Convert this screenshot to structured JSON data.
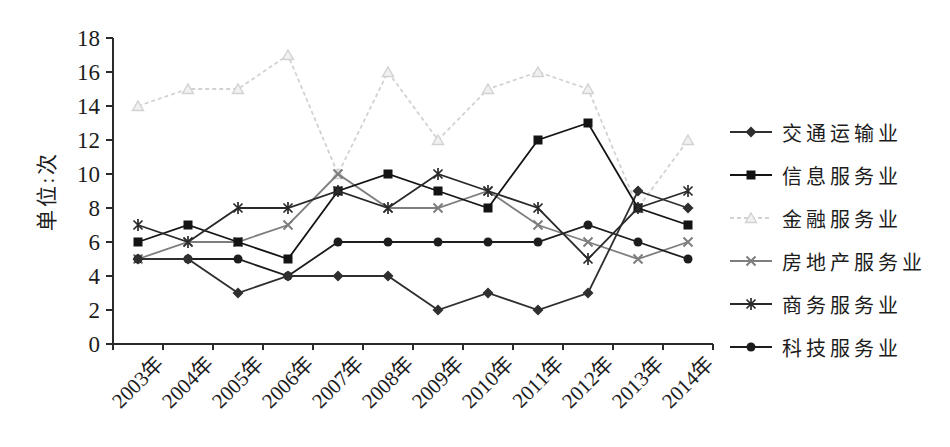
{
  "figure": {
    "background": "#ffffff"
  },
  "chart_data": {
    "type": "line",
    "title": "",
    "xlabel": "",
    "ylabel": "单位:次",
    "categories": [
      "2003年",
      "2004年",
      "2005年",
      "2006年",
      "2007年",
      "2008年",
      "2009年",
      "2010年",
      "2011年",
      "2012年",
      "2013年",
      "2014年"
    ],
    "ylim": [
      0,
      18
    ],
    "yticks": [
      0,
      2,
      4,
      6,
      8,
      10,
      12,
      14,
      16,
      18
    ],
    "grid": false,
    "legend_position": "right",
    "axis_color": "#2b2b2b",
    "series": [
      {
        "name": "交通运输业",
        "slug": "transportation",
        "marker": "diamond",
        "color": "#2f2f2f",
        "line": "solid",
        "values": [
          5,
          5,
          3,
          4,
          4,
          4,
          2,
          3,
          2,
          3,
          9,
          8
        ]
      },
      {
        "name": "信息服务业",
        "slug": "information-services",
        "marker": "square",
        "color": "#141414",
        "line": "solid",
        "values": [
          6,
          7,
          6,
          5,
          9,
          10,
          9,
          8,
          12,
          13,
          8,
          7
        ]
      },
      {
        "name": "金融服务业",
        "slug": "financial-services",
        "marker": "triangle",
        "color": "#d2d2d2",
        "line": "dashed",
        "values": [
          14,
          15,
          15,
          17,
          10,
          16,
          12,
          15,
          16,
          15,
          8,
          12
        ]
      },
      {
        "name": "房地产服务业",
        "slug": "real-estate-services",
        "marker": "x",
        "color": "#7e7e7e",
        "line": "solid",
        "values": [
          5,
          6,
          6,
          7,
          10,
          8,
          8,
          9,
          7,
          6,
          5,
          6
        ]
      },
      {
        "name": "商务服务业",
        "slug": "business-services",
        "marker": "asterisk",
        "color": "#2a2a2a",
        "line": "solid",
        "values": [
          7,
          6,
          8,
          8,
          9,
          8,
          10,
          9,
          8,
          5,
          8,
          9
        ]
      },
      {
        "name": "科技服务业",
        "slug": "technology-services",
        "marker": "circle",
        "color": "#1d1d1d",
        "line": "solid",
        "values": [
          5,
          5,
          5,
          4,
          6,
          6,
          6,
          6,
          6,
          7,
          6,
          5
        ]
      }
    ]
  }
}
